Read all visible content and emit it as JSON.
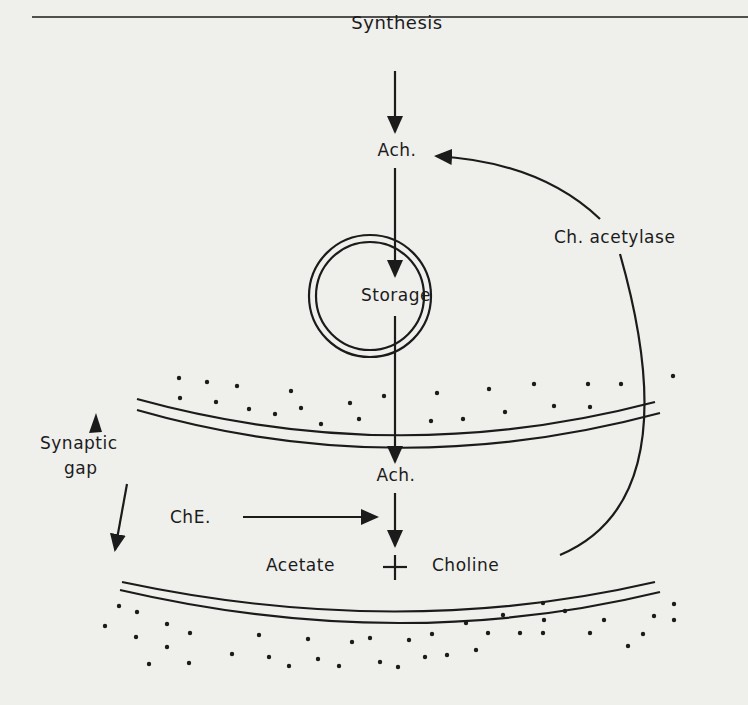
{
  "diagram": {
    "type": "acetylcholine cycle at synapse",
    "colors": {
      "background": "#efefec",
      "ink": "#1b1b1b"
    },
    "labels": {
      "synthesis": "Synthesis",
      "ach_top": "Ach.",
      "storage": "Storage",
      "ch_acetylase": "Ch. acetylase",
      "synaptic_gap_line1": "Synaptic",
      "synaptic_gap_line2": "gap",
      "ach_bottom": "Ach.",
      "che": "ChE.",
      "acetate": "Acetate",
      "plus": "+",
      "choline": "Choline"
    },
    "nodes": [
      {
        "id": "synthesis",
        "label": "Synthesis"
      },
      {
        "id": "ach1",
        "label": "Ach."
      },
      {
        "id": "storage",
        "label": "Storage",
        "shape": "double-circle vesicle"
      },
      {
        "id": "ach2",
        "label": "Ach."
      },
      {
        "id": "products",
        "label": "Acetate + Choline"
      },
      {
        "id": "che",
        "label": "ChE."
      }
    ],
    "edges": [
      {
        "from": "synthesis",
        "to": "ach1"
      },
      {
        "from": "ach1",
        "to": "storage"
      },
      {
        "from": "storage",
        "to": "ach2",
        "crosses": "presynaptic membrane"
      },
      {
        "from": "ach2",
        "to": "products"
      },
      {
        "from": "che",
        "to": "ach2-products arrow",
        "role": "enzyme"
      },
      {
        "from": "choline",
        "to": "ach1",
        "label": "Ch. acetylase",
        "style": "curved"
      }
    ],
    "structures": [
      "presynaptic membrane (double line, dotted above)",
      "postsynaptic membrane (double line, dotted below)",
      "synaptic gap (bidirectional arrows)"
    ]
  }
}
